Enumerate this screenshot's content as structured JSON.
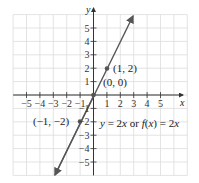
{
  "chart_data": {
    "type": "line",
    "title": "",
    "xlabel": "x",
    "ylabel": "y",
    "xlim": [
      -5,
      5
    ],
    "ylim": [
      -5,
      5
    ],
    "grid": true,
    "x_ticks": [
      -5,
      -4,
      -3,
      -2,
      -1,
      1,
      2,
      3,
      4,
      5
    ],
    "y_ticks": [
      -5,
      -4,
      -3,
      -2,
      -1,
      1,
      2,
      3,
      4,
      5
    ],
    "series": [
      {
        "name": "y = 2x or f(x) = 2x",
        "x": [
          -3,
          3
        ],
        "y": [
          -6,
          6
        ],
        "color": "#555555"
      }
    ],
    "points": [
      {
        "label": "(1, 2)",
        "x": 1,
        "y": 2
      },
      {
        "label": "(0, 0)",
        "x": 0,
        "y": 0
      },
      {
        "label": "(-1, -2)",
        "x": -1,
        "y": -2
      }
    ],
    "annotations": [
      "y = 2x or f(x) = 2x"
    ]
  },
  "labels": {
    "x_axis": "x",
    "y_axis": "y",
    "pt1": "(1, 2)",
    "pt0": "(0, 0)",
    "ptm1": "(−1, −2)",
    "eq_a": "y",
    "eq_b": " = 2",
    "eq_c": "x",
    "eq_d": " or ",
    "eq_e": "f",
    "eq_f": "(",
    "eq_g": "x",
    "eq_h": ") = 2",
    "eq_i": "x"
  }
}
